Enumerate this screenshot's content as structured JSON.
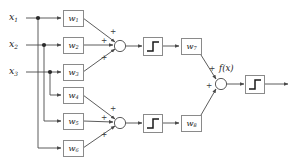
{
  "figure": {
    "type": "neural-network-diagram"
  },
  "inputs": [
    {
      "name": "x1",
      "base": "x",
      "sub": "1"
    },
    {
      "name": "x2",
      "base": "x",
      "sub": "2"
    },
    {
      "name": "x3",
      "base": "x",
      "sub": "3"
    }
  ],
  "weights": [
    {
      "name": "w1",
      "base": "w",
      "sub": "1"
    },
    {
      "name": "w2",
      "base": "w",
      "sub": "2"
    },
    {
      "name": "w3",
      "base": "w",
      "sub": "3"
    },
    {
      "name": "w4",
      "base": "w",
      "sub": "4"
    },
    {
      "name": "w5",
      "base": "w",
      "sub": "5"
    },
    {
      "name": "w6",
      "base": "w",
      "sub": "6"
    },
    {
      "name": "w7",
      "base": "w",
      "sub": "7"
    },
    {
      "name": "w8",
      "base": "w",
      "sub": "8"
    }
  ],
  "signs": {
    "plus": "+"
  },
  "sum_nodes": [
    {
      "name": "sum-top",
      "signs": [
        "+",
        "+",
        "+"
      ]
    },
    {
      "name": "sum-bottom",
      "signs": [
        "+",
        "+",
        "+"
      ]
    },
    {
      "name": "sum-output",
      "signs": [
        "+",
        "+"
      ]
    }
  ],
  "activations": [
    {
      "name": "step-top",
      "glyph": "step-function"
    },
    {
      "name": "step-bottom",
      "glyph": "step-function"
    },
    {
      "name": "step-output",
      "glyph": "step-function"
    }
  ],
  "output": {
    "label": "f(x)"
  },
  "colors": {
    "stroke": "#4a4a4a",
    "box_border": "#8a8a8a",
    "text": "#1a1a1a",
    "sign_text": "#3a3a3a",
    "background": "#ffffff"
  }
}
